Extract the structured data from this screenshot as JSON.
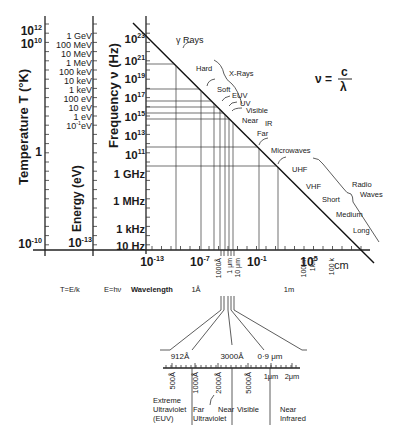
{
  "chart_data": {
    "type": "line",
    "formula": {
      "lhs": "ν =",
      "num": "c",
      "den": "λ"
    },
    "axes": {
      "temperature": {
        "label": "Temperature  T (°K)",
        "ticks": [
          {
            "t": "10",
            "e": "12",
            "y": 31
          },
          {
            "t": "10",
            "e": "10",
            "y": 44
          },
          {
            "t": "1",
            "e": "",
            "y": 152
          },
          {
            "t": "10",
            "e": "-10",
            "y": 244
          }
        ],
        "relation": "T=E/k"
      },
      "energy": {
        "label": "Energy (eV)",
        "ticks": [
          {
            "t": "1 GeV",
            "y": 36
          },
          {
            "t": "100 MeV",
            "y": 45
          },
          {
            "t": "10 MeV",
            "y": 54
          },
          {
            "t": "1 MeV",
            "y": 63
          },
          {
            "t": "100 keV",
            "y": 72
          },
          {
            "t": "10 keV",
            "y": 81
          },
          {
            "t": "1 keV",
            "y": 90
          },
          {
            "t": "100 eV",
            "y": 99
          },
          {
            "t": "10 eV",
            "y": 108
          },
          {
            "t": "1 eV",
            "y": 117
          },
          {
            "t": "10",
            "e": "-1",
            "u": "eV",
            "y": 126
          },
          {
            "t": "10",
            "e": "-13",
            "y": 244
          }
        ],
        "relation": "E=hν"
      },
      "frequency": {
        "label": "Frequency  ν  (Hz)",
        "ticks": [
          {
            "t": "10",
            "e": "23",
            "y": 39
          },
          {
            "t": "10",
            "e": "21",
            "y": 61
          },
          {
            "t": "10",
            "e": "19",
            "y": 79
          },
          {
            "t": "10",
            "e": "17",
            "y": 98
          },
          {
            "t": "10",
            "e": "15",
            "y": 117
          },
          {
            "t": "10",
            "e": "13",
            "y": 136
          },
          {
            "t": "10",
            "e": "11",
            "y": 155
          },
          {
            "t": "1 GHz",
            "y": 174
          },
          {
            "t": "1 MHz",
            "y": 201
          },
          {
            "t": "1 kHz",
            "y": 229
          },
          {
            "t": "10 Hz",
            "y": 246
          }
        ]
      },
      "wavelength": {
        "label": "Wavelength",
        "unit": "cm",
        "ticks": [
          {
            "t": "10",
            "e": "-13",
            "x": 152
          },
          {
            "t": "10",
            "e": "-7",
            "x": 200
          },
          {
            "t": "10",
            "e": "-1",
            "x": 257
          },
          {
            "t": "10",
            "e": "5",
            "x": 309
          }
        ],
        "markers": [
          {
            "t": "1Å",
            "x": 196,
            "rot": false
          },
          {
            "t": "1000Å",
            "x": 221,
            "rot": true
          },
          {
            "t": "1 μm",
            "x": 232,
            "rot": true
          },
          {
            "t": "10 μm",
            "x": 240,
            "rot": true
          },
          {
            "t": "1m",
            "x": 289,
            "rot": false
          },
          {
            "t": "100 m",
            "x": 306,
            "rot": true
          },
          {
            "t": "1km",
            "x": 315,
            "rot": true
          },
          {
            "t": "100 k",
            "x": 334,
            "rot": true
          }
        ]
      }
    },
    "bands": [
      {
        "name": "γ Rays",
        "x": 176,
        "y": 43
      },
      {
        "name": "Hard",
        "x": 196,
        "y": 71
      },
      {
        "name": "X-Rays",
        "x": 229,
        "y": 76
      },
      {
        "name": "Soft",
        "x": 217,
        "y": 92
      },
      {
        "name": "EUV",
        "x": 232,
        "y": 98
      },
      {
        "name": "UV",
        "x": 240,
        "y": 106
      },
      {
        "name": "Visible",
        "x": 246,
        "y": 113
      },
      {
        "name": "Near",
        "x": 242,
        "y": 123
      },
      {
        "name": "IR",
        "x": 265,
        "y": 126
      },
      {
        "name": "Far",
        "x": 257,
        "y": 136
      },
      {
        "name": "Microwaves",
        "x": 271,
        "y": 153
      },
      {
        "name": "UHF",
        "x": 292,
        "y": 172
      },
      {
        "name": "VHF",
        "x": 306,
        "y": 189
      },
      {
        "name": "Short",
        "x": 322,
        "y": 202
      },
      {
        "name": "Medium",
        "x": 336,
        "y": 217
      },
      {
        "name": "Long",
        "x": 353,
        "y": 233
      },
      {
        "name": "Radio",
        "x": 352,
        "y": 187
      },
      {
        "name": "Waves",
        "x": 360,
        "y": 197
      }
    ],
    "inset": {
      "boundaries": [
        {
          "t": "912Å",
          "x": 180
        },
        {
          "t": "3000Å",
          "x": 232
        },
        {
          "t": "0·9 μm",
          "x": 270
        }
      ],
      "scale_ticks": [
        {
          "t": "500Å",
          "x": 172
        },
        {
          "t": "1000Å",
          "x": 195
        },
        {
          "t": "2000Å",
          "x": 218
        },
        {
          "t": "5000Å",
          "x": 248
        },
        {
          "t": "1μm",
          "x": 271,
          "rot": false
        },
        {
          "t": "2μm",
          "x": 292,
          "rot": false
        }
      ],
      "regions": [
        {
          "lines": [
            "Extreme",
            "Ultraviolet",
            "(EUV)"
          ],
          "x": 153
        },
        {
          "lines": [
            "Far",
            "Ultraviolet"
          ],
          "x": 193
        },
        {
          "lines": [
            "Near"
          ],
          "x": 218
        },
        {
          "lines": [
            "Visible"
          ],
          "x": 237
        },
        {
          "lines": [
            "Near",
            "Infrared"
          ],
          "x": 280
        }
      ]
    }
  }
}
